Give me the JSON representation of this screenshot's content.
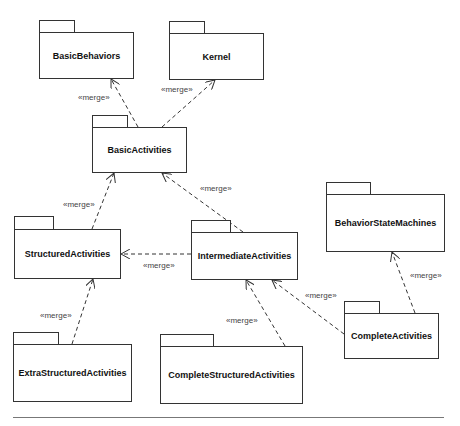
{
  "diagram": {
    "type": "UML package diagram",
    "packages": [
      {
        "id": "basic-behaviors",
        "name": "BasicBehaviors"
      },
      {
        "id": "kernel",
        "name": "Kernel"
      },
      {
        "id": "basic-activities",
        "name": "BasicActivities"
      },
      {
        "id": "structured-activities",
        "name": "StructuredActivities"
      },
      {
        "id": "intermediate-activities",
        "name": "IntermediateActivities"
      },
      {
        "id": "behavior-state-machines",
        "name": "BehaviorStateMachines"
      },
      {
        "id": "complete-activities",
        "name": "CompleteActivities"
      },
      {
        "id": "extra-structured-activities",
        "name": "ExtraStructuredActivities"
      },
      {
        "id": "complete-structured-activities",
        "name": "CompleteStructuredActivities"
      }
    ],
    "dependencies": [
      {
        "from": "BasicActivities",
        "to": "BasicBehaviors",
        "stereotype": "«merge»"
      },
      {
        "from": "BasicActivities",
        "to": "Kernel",
        "stereotype": "«merge»"
      },
      {
        "from": "StructuredActivities",
        "to": "BasicActivities",
        "stereotype": "«merge»"
      },
      {
        "from": "IntermediateActivities",
        "to": "BasicActivities",
        "stereotype": "«merge»"
      },
      {
        "from": "IntermediateActivities",
        "to": "StructuredActivities",
        "stereotype": "«merge»"
      },
      {
        "from": "ExtraStructuredActivities",
        "to": "StructuredActivities",
        "stereotype": "«merge»"
      },
      {
        "from": "CompleteStructuredActivities",
        "to": "IntermediateActivities",
        "stereotype": "«merge»"
      },
      {
        "from": "CompleteActivities",
        "to": "IntermediateActivities",
        "stereotype": "«merge»"
      },
      {
        "from": "CompleteActivities",
        "to": "BehaviorStateMachines",
        "stereotype": "«merge»"
      }
    ]
  },
  "colors": {
    "line": "#333333",
    "label": "#444444",
    "background": "#ffffff"
  }
}
